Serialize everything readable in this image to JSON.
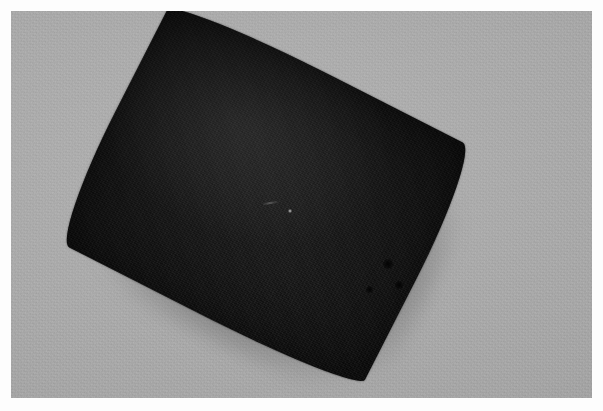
{
  "image": {
    "kind": "photograph",
    "subject": "dark elliptical specimen on plain gray background",
    "caption": "",
    "width": 603,
    "height": 411
  },
  "frame": {
    "border_color": "#fdfdfd",
    "border_left": 11,
    "border_top": 11,
    "border_right": 11,
    "border_bottom": 13
  },
  "background": {
    "name": "gray-backdrop",
    "color": "#a9a9a9",
    "color_light": "#b1b1b1",
    "color_dark": "#999999",
    "texture": "fine photographic grain"
  },
  "specimen": {
    "name": "dark-elliptical-object",
    "shape": "pointed oval (lens / almond / leaf outline)",
    "color": "#171717",
    "color_highlight": "#242424",
    "color_shadow": "#101010",
    "rotation_deg": 27,
    "left": 94,
    "top": 59,
    "width": 344,
    "height": 272
  },
  "shadow": {
    "name": "contact-shadow",
    "color": "rgba(40,40,40,0.55)",
    "offset_x": 7,
    "offset_y": 9,
    "blur": 9
  },
  "marks": [
    {
      "name": "center-speck",
      "type": "specular-highlight",
      "left": 288,
      "top": 209,
      "size": 4
    },
    {
      "name": "center-streak",
      "type": "pale-fiber",
      "left": 262,
      "top": 202,
      "size": 17
    },
    {
      "name": "blemish-a",
      "type": "dark-spot",
      "left": 383,
      "top": 259,
      "size": 10
    },
    {
      "name": "blemish-b",
      "type": "dark-spot",
      "left": 395,
      "top": 281,
      "size": 8
    },
    {
      "name": "blemish-c",
      "type": "dark-spot",
      "left": 366,
      "top": 286,
      "size": 7
    }
  ]
}
